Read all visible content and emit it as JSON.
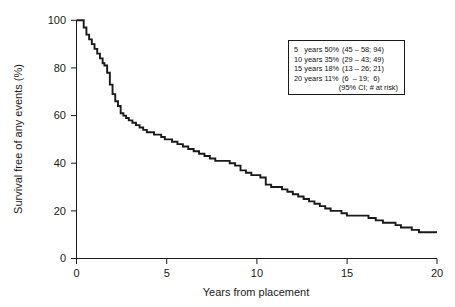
{
  "chart_data": {
    "type": "line",
    "title": "",
    "subtitle": "",
    "xlabel": "Years from placement",
    "ylabel": "Survival free of any events (%)",
    "xlim": [
      0,
      20
    ],
    "ylim": [
      0,
      100
    ],
    "xticks": [
      0,
      5,
      10,
      15,
      20
    ],
    "yticks": [
      0,
      20,
      40,
      60,
      80,
      100
    ],
    "xtick_labels": [
      "0",
      "5",
      "10",
      "15",
      "20"
    ],
    "ytick_labels": [
      "0",
      "20",
      "40",
      "60",
      "80",
      "100"
    ],
    "grid": false,
    "legend_position": "upper-right inset box",
    "curve_style": "step (Kaplan-Meier)",
    "series": [
      {
        "name": "Survival free of any events",
        "x": [
          0.0,
          0.25,
          0.4,
          0.55,
          0.7,
          0.85,
          1.0,
          1.15,
          1.3,
          1.45,
          1.55,
          1.7,
          1.85,
          2.0,
          2.15,
          2.3,
          2.45,
          2.6,
          2.75,
          2.9,
          3.1,
          3.3,
          3.5,
          3.7,
          3.9,
          4.1,
          4.3,
          4.5,
          4.7,
          4.9,
          5.0,
          5.3,
          5.6,
          5.9,
          6.2,
          6.5,
          6.8,
          7.1,
          7.4,
          7.7,
          7.9,
          8.2,
          8.5,
          8.8,
          9.1,
          9.4,
          9.7,
          10.0,
          10.2,
          10.5,
          10.8,
          11.1,
          11.4,
          11.7,
          12.0,
          12.3,
          12.6,
          12.9,
          13.2,
          13.5,
          13.8,
          14.1,
          14.4,
          14.7,
          15.0,
          15.4,
          15.8,
          16.2,
          16.6,
          17.0,
          17.4,
          17.7,
          18.0,
          18.6,
          19.0,
          19.5,
          20.0
        ],
        "y": [
          100,
          100,
          97,
          94,
          92,
          90,
          88,
          86,
          84,
          82,
          81,
          78,
          73,
          69,
          66,
          64,
          61,
          60,
          59,
          58,
          57,
          56,
          55,
          54,
          53,
          53,
          52,
          52,
          51,
          50,
          50,
          49,
          48,
          47,
          46,
          45,
          44,
          43,
          42,
          41,
          41,
          41,
          40,
          39,
          37,
          36,
          35,
          35,
          34,
          31,
          30,
          30,
          29,
          28,
          27,
          26,
          25,
          24,
          23,
          22,
          21,
          20,
          20,
          19,
          18,
          18,
          18,
          17,
          16,
          15,
          15,
          14,
          13,
          12,
          11,
          11,
          11
        ]
      }
    ],
    "annotations": {
      "risk_table_rows": [
        {
          "time_label": "5",
          "unit": "years",
          "survival": "50%",
          "ci": "(45 – 58; 94)"
        },
        {
          "time_label": "10",
          "unit": "years",
          "survival": "35%",
          "ci": "(29 – 43; 49)"
        },
        {
          "time_label": "15",
          "unit": "years",
          "survival": "18%",
          "ci": "(13 – 26; 21)"
        },
        {
          "time_label": "20",
          "unit": "years",
          "survival": "11%",
          "ci": "(6  – 19;  6)"
        }
      ],
      "risk_table_footer": "(95% CI; # at risk)"
    }
  },
  "legend": {
    "rows": [
      {
        "label": "5   years 50%",
        "ci": "(45 – 58; 94)"
      },
      {
        "label": "10 years 35%",
        "ci": "(29 – 43; 49)"
      },
      {
        "label": "15 years 18%",
        "ci": "(13 – 26; 21)"
      },
      {
        "label": "20 years 11%",
        "ci": "(6  – 19;  6)"
      }
    ],
    "footer": "(95% CI; # at risk)"
  },
  "axes": {
    "x_title": "Years from placement",
    "y_title": "Survival free of any events (%)",
    "x_labels": [
      "0",
      "5",
      "10",
      "15",
      "20"
    ],
    "y_labels": [
      "0",
      "20",
      "40",
      "60",
      "80",
      "100"
    ]
  },
  "colors": {
    "curve": "#1a1a1a",
    "axis": "#1a1a1a",
    "background": "#ffffff",
    "legend_border": "#1a1a1a"
  }
}
